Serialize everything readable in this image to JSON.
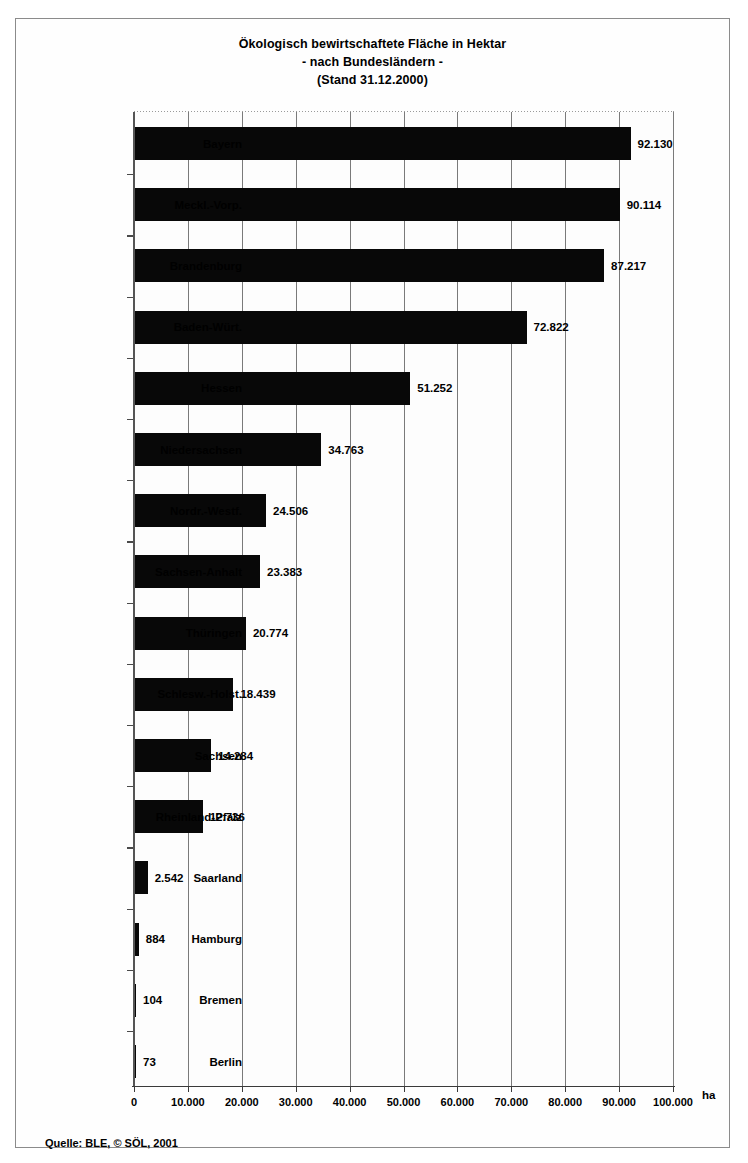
{
  "chart_data": {
    "type": "bar",
    "orientation": "horizontal",
    "title": "Ökologisch bewirtschaftete Fläche in Hektar",
    "subtitle": "- nach Bundesländern -",
    "subtitle2": "(Stand 31.12.2000)",
    "xlabel": "",
    "ylabel": "",
    "unit": "ha",
    "grid": true,
    "legend": null,
    "xlim": [
      0,
      100000
    ],
    "xticks": [
      0,
      10000,
      20000,
      30000,
      40000,
      50000,
      60000,
      70000,
      80000,
      90000,
      100000
    ],
    "xtick_labels": [
      "0",
      "10.000",
      "20.000",
      "30.000",
      "40.000",
      "50.000",
      "60.000",
      "70.000",
      "80.000",
      "90.000",
      "100.000"
    ],
    "categories": [
      "Bayern",
      "Meckl.-Vorp.",
      "Brandenburg",
      "Baden-Würt.",
      "Hessen",
      "Niedersachsen",
      "Nordr.-Westf.",
      "Sachsen-Anhalt",
      "Thüringen",
      "Schlesw.-Holst.",
      "Sachsen",
      "Rheinland-Pfalz",
      "Saarland",
      "Hamburg",
      "Bremen",
      "Berlin"
    ],
    "values": [
      92130,
      90114,
      87217,
      72822,
      51252,
      34763,
      24506,
      23383,
      20774,
      18439,
      14284,
      12736,
      2542,
      884,
      104,
      73
    ],
    "value_labels": [
      "92.130",
      "90.114",
      "87.217",
      "72.822",
      "51.252",
      "34.763",
      "24.506",
      "23.383",
      "20.774",
      "18.439",
      "14.284",
      "12.736",
      "2.542",
      "884",
      "104",
      "73"
    ],
    "bar_color": "#080808",
    "grid_color": "#7a7a7a"
  },
  "source": {
    "text": "Quelle: BLE, © SÖL, 2001"
  }
}
